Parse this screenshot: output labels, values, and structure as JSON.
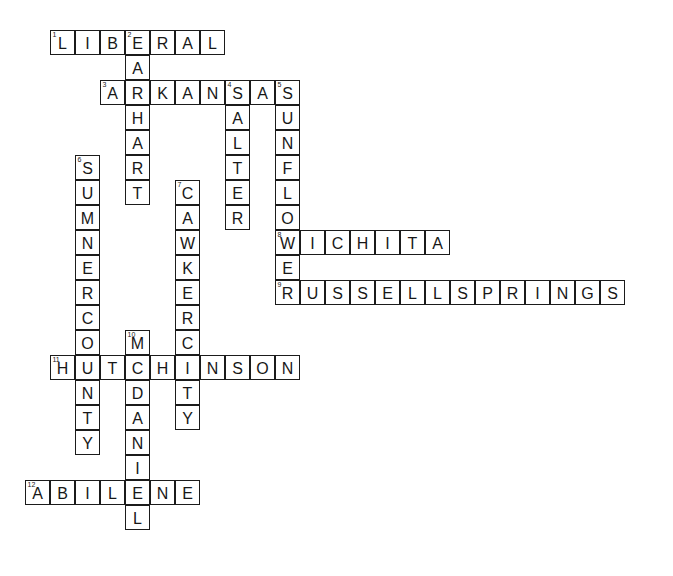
{
  "puzzle": {
    "title": "Kansas Crossword Puzzle",
    "grid": {
      "cell_size": 25,
      "origin_x": 25,
      "origin_y": 30,
      "columns": 26,
      "rows": 22,
      "border_color": "#1b1b1b",
      "cell_fill": "#ffffff",
      "text_color": "#171717",
      "background": "#ffffff"
    },
    "entries": [
      {
        "number": "1",
        "direction": "across",
        "answer": "LIBERAL",
        "row": 0,
        "col": 1,
        "length": 7
      },
      {
        "number": "2",
        "direction": "down",
        "answer": "EARHART",
        "row": 0,
        "col": 4,
        "length": 7
      },
      {
        "number": "3",
        "direction": "across",
        "answer": "ARKANSAS",
        "row": 2,
        "col": 3,
        "length": 8
      },
      {
        "number": "4",
        "direction": "down",
        "answer": "SALTER",
        "row": 2,
        "col": 8,
        "length": 6
      },
      {
        "number": "5",
        "direction": "down",
        "answer": "SUNFLOWER",
        "row": 2,
        "col": 10,
        "length": 9
      },
      {
        "number": "6",
        "direction": "down",
        "answer": "SUMNERCOUNTY",
        "row": 5,
        "col": 2,
        "length": 12
      },
      {
        "number": "7",
        "direction": "down",
        "answer": "CAWKERCITY",
        "row": 6,
        "col": 6,
        "length": 10
      },
      {
        "number": "8",
        "direction": "across",
        "answer": "WICHITA",
        "row": 8,
        "col": 10,
        "length": 7
      },
      {
        "number": "9",
        "direction": "across",
        "answer": "RUSSELLSPRINGS",
        "row": 10,
        "col": 10,
        "length": 14
      },
      {
        "number": "10",
        "direction": "down",
        "answer": "MCDANIEL",
        "row": 12,
        "col": 4,
        "length": 8
      },
      {
        "number": "11",
        "direction": "across",
        "answer": "HUTCHINSON",
        "row": 13,
        "col": 1,
        "length": 10
      },
      {
        "number": "12",
        "direction": "across",
        "answer": "ABILENE",
        "row": 18,
        "col": 0,
        "length": 7
      }
    ]
  }
}
